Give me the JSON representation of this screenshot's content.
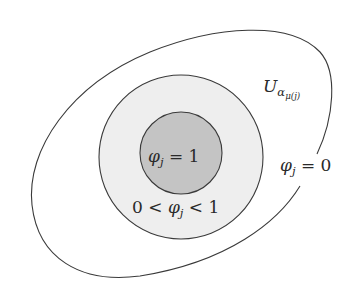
{
  "figure": {
    "type": "nested-region-diagram",
    "colors": {
      "background": "#ffffff",
      "stroke": "#3a3a3a",
      "middle_fill": "#eeeeee",
      "inner_fill": "#c4c4c4"
    },
    "regions": {
      "outer": {
        "label_base": "U",
        "label_sub": "α",
        "label_subsub": "μ(j)",
        "label_full": "U_{α_{μ(j)}}",
        "boundary_note": "open curve with a gap on the right"
      },
      "outer_annotation": {
        "lhs": "φ",
        "sub": "j",
        "rhs": " = 0",
        "full": "φ_j = 0"
      },
      "middle": {
        "prefix": "0 < ",
        "var": "φ",
        "sub": "j",
        "suffix": " < 1",
        "full": "0 < φ_j < 1"
      },
      "inner": {
        "var": "φ",
        "sub": "j",
        "rhs": " = 1",
        "full": "φ_j = 1"
      }
    }
  }
}
